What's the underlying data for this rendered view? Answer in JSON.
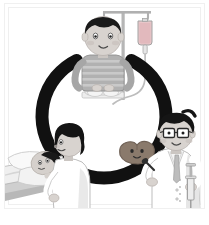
{
  "illustration": {
    "title": "Medical care cycle illustration",
    "background_color": "#ffffff",
    "frame": {
      "border_color": "#f0f0f0",
      "inset_border_color": "#e8e8e8",
      "bottom_band_color": "#ffffff"
    },
    "ring": {
      "name": "care cycle ring",
      "color": "#111111",
      "center_x": 104,
      "center_y": 116,
      "radius": 62,
      "stroke_width": 13,
      "gap_top_degrees": 70
    },
    "scenes": [
      {
        "id": "iv-patient",
        "label": "Boy seated receiving IV drip",
        "position": "top-center",
        "figure": {
          "name": "seated boy patient",
          "hair_color": "#1a1a1a",
          "skin_color": "#d8d3cf",
          "shirt_color": "#a9a9a9",
          "shirt_pattern": "horizontal stripes",
          "stripe_color": "#c9c9c9",
          "pants_color": "#ededed",
          "expression": "calm"
        },
        "equipment": {
          "name": "iv-drip-stand",
          "pole_color": "#b6b6b6",
          "crossbar_color": "#b0b0b0",
          "bag_fill_color": "#e2b9bd",
          "bag_outline_color": "#9b9b9b",
          "tube_color": "#bdbdbd",
          "drip_chamber_color": "#d6d6d6"
        }
      },
      {
        "id": "bedside-care",
        "label": "Nurse caring for patient lying in bed",
        "position": "bottom-left",
        "figures": [
          {
            "name": "nurse caregiver",
            "hair_color": "#141414",
            "skin_color": "#d8d3cf",
            "uniform_color": "#ffffff",
            "uniform_shade_color": "#e3e3e3"
          },
          {
            "name": "bedridden patient",
            "hair_color": "#191919",
            "skin_color": "#d5d0cc",
            "gown_color": "#f2f2f2"
          }
        ],
        "bed": {
          "name": "hospital-bed",
          "mattress_color": "#efefef",
          "pillow_color": "#f7f7f7",
          "frame_color": "#c9c9c9",
          "shadow_color": "#b8b8b8"
        }
      },
      {
        "id": "doctor-injection",
        "label": "Doctor in white coat holding syringe",
        "position": "bottom-right",
        "figure": {
          "name": "doctor",
          "hair_color": "#151515",
          "skin_color": "#d8d3cf",
          "glasses": true,
          "glasses_frame_color": "#2a2a2a",
          "coat_color": "#ffffff",
          "coat_shade_color": "#e0e0e0",
          "shirt_color": "#f4f4f4",
          "tie_color": "#bdbdbd"
        },
        "equipment": [
          {
            "name": "syringe",
            "barrel_color": "#ededed",
            "outline_color": "#9a9a9a",
            "needle_color": "#8f8f8f"
          },
          {
            "name": "otoscope-probe",
            "color": "#2e2e2e"
          }
        ]
      },
      {
        "id": "organ-mascot",
        "label": "Smiling liver mascot character",
        "position": "center",
        "figure": {
          "name": "liver-mascot",
          "body_color": "#8a7a6c",
          "outline_color": "#6f6156",
          "eye_color": "#2a2a2a",
          "expression": "smiling"
        }
      }
    ],
    "palette": {
      "ink": "#111111",
      "skin": "#d8d3cf",
      "white": "#ffffff",
      "light_gray": "#ededed",
      "mid_gray": "#b6b6b6",
      "dark_gray": "#7d7d7d",
      "iv_bag_pink": "#e2b9bd",
      "organ_brown": "#8a7a6c"
    }
  }
}
